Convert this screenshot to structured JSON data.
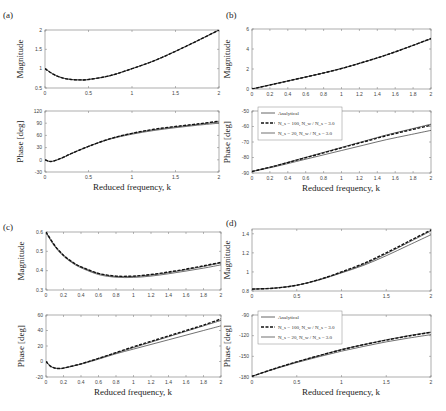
{
  "chart_data": [
    {
      "panel": "(a)",
      "type": "line",
      "subplots": [
        {
          "name": "magnitude",
          "ylabel": "Magnitude",
          "xlim": [
            0,
            2
          ],
          "ylim": [
            0.5,
            2
          ],
          "xticks": [
            "0",
            "0.5",
            "1",
            "1.5",
            "2"
          ],
          "yticks": [
            "0.5",
            "1",
            "1.5",
            "2"
          ],
          "x": [
            0,
            0.1,
            0.2,
            0.3,
            0.4,
            0.5,
            0.75,
            1.0,
            1.25,
            1.5,
            1.75,
            2.0
          ],
          "series": [
            {
              "name": "Analytical",
              "values": [
                1.0,
                0.85,
                0.76,
                0.72,
                0.71,
                0.72,
                0.82,
                1.0,
                1.2,
                1.45,
                1.72,
                2.0
              ]
            },
            {
              "name": "N_s = 100, N_w / N_s = 3.0",
              "values": [
                1.0,
                0.85,
                0.76,
                0.72,
                0.71,
                0.72,
                0.82,
                1.0,
                1.2,
                1.45,
                1.72,
                2.0
              ]
            },
            {
              "name": "N_s = 20, N_w / N_s = 3.0",
              "values": [
                1.0,
                0.85,
                0.76,
                0.72,
                0.71,
                0.72,
                0.82,
                1.0,
                1.2,
                1.45,
                1.72,
                2.0
              ]
            }
          ]
        },
        {
          "name": "phase",
          "ylabel": "Phase [deg]",
          "xlabel": "Reduced frequency, k",
          "xlim": [
            0,
            2
          ],
          "ylim": [
            -30,
            120
          ],
          "xticks": [
            "0",
            "0.5",
            "1",
            "1.5",
            "2"
          ],
          "yticks": [
            "-30",
            "0",
            "30",
            "60",
            "90",
            "120"
          ],
          "x": [
            0,
            0.05,
            0.1,
            0.2,
            0.3,
            0.5,
            0.75,
            1.0,
            1.25,
            1.5,
            1.75,
            2.0
          ],
          "series": [
            {
              "name": "Analytical",
              "values": [
                0,
                -4,
                -3,
                5,
                15,
                33,
                52,
                65,
                74,
                81,
                87,
                93
              ]
            },
            {
              "name": "N_s = 100, N_w / N_s = 3.0",
              "values": [
                0,
                -4,
                -3,
                5,
                15,
                33,
                52,
                65,
                75,
                82,
                88,
                95
              ]
            },
            {
              "name": "N_s = 20, N_w / N_s = 3.0",
              "values": [
                0,
                -4,
                -3,
                5,
                15,
                33,
                51,
                63,
                72,
                79,
                85,
                90
              ]
            }
          ]
        }
      ]
    },
    {
      "panel": "(b)",
      "type": "line",
      "subplots": [
        {
          "name": "magnitude",
          "ylabel": "Magnitude",
          "xlim": [
            0,
            2
          ],
          "ylim": [
            0,
            6
          ],
          "xticks": [
            "0",
            "0.2",
            "0.4",
            "0.6",
            "0.8",
            "1",
            "1.2",
            "1.4",
            "1.6",
            "1.8",
            "2"
          ],
          "yticks": [
            "0",
            "2",
            "4",
            "6"
          ],
          "x": [
            0,
            0.25,
            0.5,
            0.75,
            1.0,
            1.25,
            1.5,
            1.75,
            2.0
          ],
          "series": [
            {
              "name": "Analytical",
              "values": [
                0,
                0.5,
                1.0,
                1.5,
                2.05,
                2.7,
                3.4,
                4.2,
                5.05
              ]
            },
            {
              "name": "N_s = 100, N_w / N_s = 3.0",
              "values": [
                0,
                0.5,
                1.0,
                1.5,
                2.05,
                2.7,
                3.4,
                4.2,
                5.05
              ]
            },
            {
              "name": "N_s = 20, N_w / N_s = 3.0",
              "values": [
                0,
                0.5,
                1.0,
                1.5,
                2.05,
                2.7,
                3.4,
                4.2,
                5.0
              ]
            }
          ]
        },
        {
          "name": "phase",
          "ylabel": "Phase [deg]",
          "xlabel": "Reduced frequency, k",
          "xlim": [
            0,
            2
          ],
          "ylim": [
            -90,
            -50
          ],
          "xticks": [
            "0",
            "0.2",
            "0.4",
            "0.6",
            "0.8",
            "1",
            "1.2",
            "1.4",
            "1.6",
            "1.8",
            "2"
          ],
          "yticks": [
            "-90",
            "-80",
            "-70",
            "-60",
            "-50"
          ],
          "x": [
            0,
            0.25,
            0.5,
            0.75,
            1.0,
            1.25,
            1.5,
            1.75,
            2.0
          ],
          "series": [
            {
              "name": "Analytical",
              "values": [
                -89,
                -85.5,
                -81.5,
                -77.5,
                -73.5,
                -69.5,
                -65.5,
                -62,
                -58.5
              ]
            },
            {
              "name": "N_s = 100, N_w / N_s = 3.0",
              "values": [
                -89,
                -85.6,
                -81.7,
                -77.8,
                -73.8,
                -69.9,
                -66,
                -62.5,
                -59.2
              ]
            },
            {
              "name": "N_s = 20, N_w / N_s = 3.0",
              "values": [
                -89,
                -86,
                -82.5,
                -79,
                -75.5,
                -72,
                -68.5,
                -65.5,
                -62.5
              ]
            }
          ]
        }
      ],
      "legend": [
        "Analytical",
        "N_s = 100, N_w / N_s = 3.0",
        "N_s = 20, N_w / N_s = 3.0"
      ]
    },
    {
      "panel": "(c)",
      "type": "line",
      "subplots": [
        {
          "name": "magnitude",
          "ylabel": "Magnitude",
          "xlim": [
            0,
            2
          ],
          "ylim": [
            0.3,
            0.6
          ],
          "xticks": [
            "0",
            "0.2",
            "0.4",
            "0.6",
            "0.8",
            "1",
            "1.2",
            "1.4",
            "1.6",
            "1.8",
            "2"
          ],
          "yticks": [
            "0.3",
            "0.4",
            "0.5",
            "0.6"
          ],
          "x": [
            0,
            0.1,
            0.2,
            0.3,
            0.4,
            0.6,
            0.8,
            1.0,
            1.2,
            1.4,
            1.6,
            1.8,
            2.0
          ],
          "series": [
            {
              "name": "Analytical",
              "values": [
                0.6,
                0.53,
                0.48,
                0.445,
                0.42,
                0.385,
                0.37,
                0.37,
                0.378,
                0.39,
                0.405,
                0.422,
                0.44
              ]
            },
            {
              "name": "N_s = 100, N_w / N_s = 3.0",
              "values": [
                0.6,
                0.53,
                0.48,
                0.445,
                0.42,
                0.386,
                0.372,
                0.372,
                0.38,
                0.393,
                0.408,
                0.425,
                0.443
              ]
            },
            {
              "name": "N_s = 20, N_w / N_s = 3.0",
              "values": [
                0.595,
                0.525,
                0.475,
                0.44,
                0.415,
                0.38,
                0.366,
                0.365,
                0.372,
                0.384,
                0.398,
                0.413,
                0.43
              ]
            }
          ]
        },
        {
          "name": "phase",
          "ylabel": "Phase [deg]",
          "xlabel": "Reduced frequency, k",
          "xlim": [
            0,
            2
          ],
          "ylim": [
            -20,
            60
          ],
          "xticks": [
            "0",
            "0.2",
            "0.4",
            "0.6",
            "0.8",
            "1",
            "1.2",
            "1.4",
            "1.6",
            "1.8",
            "2"
          ],
          "yticks": [
            "-20",
            "0",
            "20",
            "40",
            "60"
          ],
          "x": [
            0,
            0.05,
            0.1,
            0.15,
            0.2,
            0.4,
            0.6,
            0.8,
            1.0,
            1.2,
            1.4,
            1.6,
            1.8,
            2.0
          ],
          "series": [
            {
              "name": "Analytical",
              "values": [
                0,
                -6,
                -8.5,
                -9,
                -8.5,
                -3,
                4,
                11,
                18,
                25,
                32,
                39,
                46,
                53
              ]
            },
            {
              "name": "N_s = 100, N_w / N_s = 3.0",
              "values": [
                0,
                -6,
                -8.5,
                -9,
                -8.5,
                -3,
                4,
                11.5,
                19,
                26,
                33,
                40,
                47,
                55
              ]
            },
            {
              "name": "N_s = 20, N_w / N_s = 3.0",
              "values": [
                0,
                -6,
                -8.5,
                -9,
                -8.5,
                -3.5,
                3,
                10,
                16,
                22,
                28,
                34,
                40,
                46
              ]
            }
          ]
        }
      ]
    },
    {
      "panel": "(d)",
      "type": "line",
      "subplots": [
        {
          "name": "magnitude",
          "ylabel": "Magnitude",
          "xlim": [
            0,
            2
          ],
          "ylim": [
            0.8,
            1.45
          ],
          "xticks": [
            "0",
            "0.5",
            "1",
            "1.5",
            "2"
          ],
          "yticks": [
            "0.8",
            "1",
            "1.2",
            "1.4"
          ],
          "x": [
            0,
            0.25,
            0.5,
            0.75,
            1.0,
            1.25,
            1.5,
            1.75,
            2.0
          ],
          "series": [
            {
              "name": "Analytical",
              "values": [
                0.82,
                0.83,
                0.86,
                0.92,
                0.995,
                1.08,
                1.19,
                1.31,
                1.43
              ]
            },
            {
              "name": "N_s = 100, N_w / N_s = 3.0",
              "values": [
                0.82,
                0.83,
                0.86,
                0.92,
                1.0,
                1.09,
                1.2,
                1.32,
                1.44
              ]
            },
            {
              "name": "N_s = 20, N_w / N_s = 3.0",
              "values": [
                0.82,
                0.83,
                0.86,
                0.915,
                0.99,
                1.07,
                1.17,
                1.28,
                1.39
              ]
            }
          ]
        },
        {
          "name": "phase",
          "ylabel": "Phase [deg]",
          "xlabel": "Reduced frequency, k",
          "xlim": [
            0,
            2
          ],
          "ylim": [
            -180,
            -90
          ],
          "xticks": [
            "0",
            "0.5",
            "1",
            "1.5",
            "2"
          ],
          "yticks": [
            "-180",
            "-150",
            "-120",
            "-90"
          ],
          "x": [
            0,
            0.25,
            0.5,
            0.75,
            1.0,
            1.25,
            1.5,
            1.75,
            2.0
          ],
          "series": [
            {
              "name": "Analytical",
              "values": [
                -179,
                -168,
                -158,
                -149,
                -140,
                -133,
                -126,
                -120,
                -115
              ]
            },
            {
              "name": "N_s = 100, N_w / N_s = 3.0",
              "values": [
                -179,
                -168,
                -158,
                -149,
                -140.5,
                -133,
                -126.5,
                -120.5,
                -115
              ]
            },
            {
              "name": "N_s = 20, N_w / N_s = 3.0",
              "values": [
                -179,
                -168.5,
                -159,
                -150.5,
                -142.5,
                -135.5,
                -129,
                -123.5,
                -118.5
              ]
            }
          ]
        }
      ],
      "legend": [
        "Analytical",
        "N_s = 100, N_w / N_s = 3.0",
        "N_s = 20, N_w / N_s = 3.0"
      ]
    }
  ],
  "labels": {
    "panel_a": "(a)",
    "panel_b": "(b)",
    "panel_c": "(c)",
    "panel_d": "(d)",
    "magnitude": "Magnitude",
    "phase": "Phase [deg]",
    "xlabel": "Reduced frequency, k",
    "legend_analytical": "Analytical",
    "legend_ns100": "N_s = 100, N_w / N_s = 3.0",
    "legend_ns20": "N_s = 20, N_w / N_s = 3.0"
  }
}
